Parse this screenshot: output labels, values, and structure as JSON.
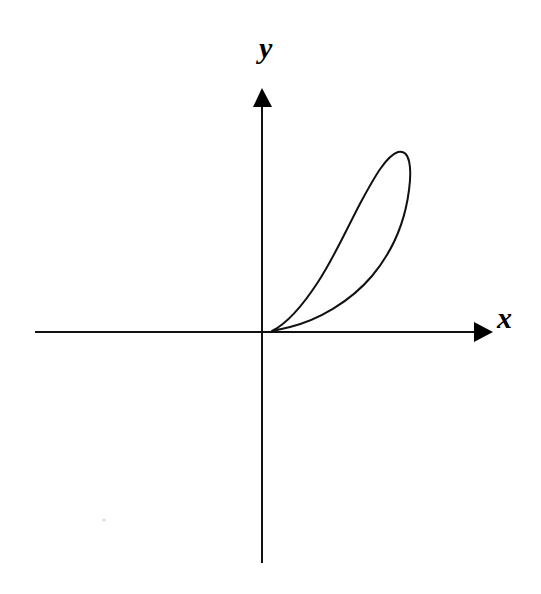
{
  "diagram": {
    "type": "coordinate-axes-with-curve",
    "axes": {
      "x": {
        "label": "x",
        "direction": "right",
        "arrow": true
      },
      "y": {
        "label": "y",
        "direction": "up",
        "arrow": true
      }
    },
    "curve": {
      "kind": "closed-loop",
      "quadrant": "first",
      "passes_through_origin": true,
      "shape": "teardrop lobe tilted toward upper right"
    },
    "colors": {
      "stroke": "#111111",
      "background": "#ffffff"
    }
  }
}
